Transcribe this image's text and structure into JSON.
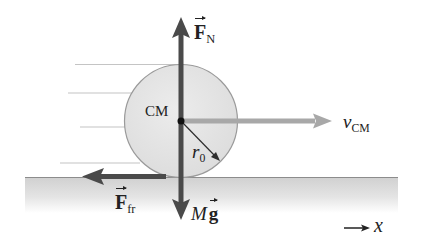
{
  "diagram": {
    "labels": {
      "normal_force": {
        "symbol": "F",
        "subscript": "N"
      },
      "friction_force": {
        "symbol": "F",
        "subscript": "fr"
      },
      "weight": {
        "mass": "M",
        "vector": "g"
      },
      "center_of_mass": "CM",
      "radius": {
        "symbol": "r",
        "subscript": "0"
      },
      "velocity": {
        "symbol": "v",
        "subscript": "CM"
      },
      "axis": "x"
    },
    "colors": {
      "force_arrow": "#4a4a4a",
      "velocity_arrow": "#a8a8a8",
      "wheel_fill": "#e6e6e6",
      "wheel_stroke": "#9a9a9a",
      "ground_top": "#d2d2d2",
      "ground_line": "#8c8c8c",
      "motion_lines": "#c4c4c4",
      "text": "#222222"
    }
  }
}
